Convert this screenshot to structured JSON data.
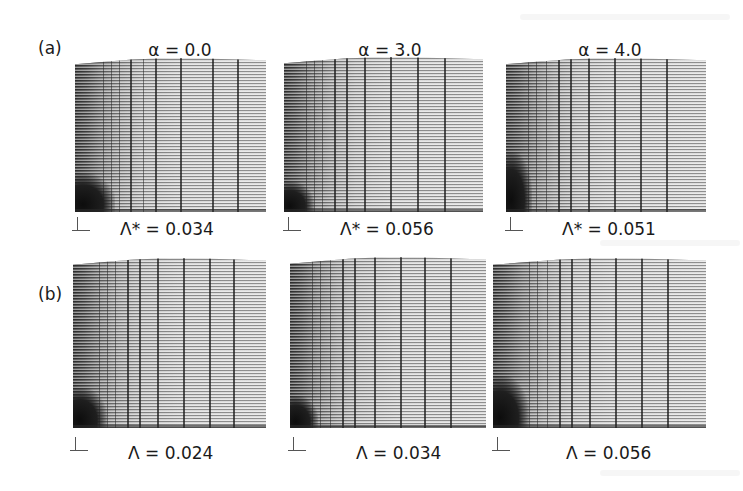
{
  "figure": {
    "rows": [
      {
        "label": "(a)",
        "panels": [
          {
            "title": "α = 0.0",
            "caption": "Λ* = 0.034",
            "symbol": "Λ*",
            "value": "0.034",
            "alpha": "0.0"
          },
          {
            "title": "α = 3.0",
            "caption": "Λ* = 0.056",
            "symbol": "Λ*",
            "value": "0.056",
            "alpha": "3.0"
          },
          {
            "title": "α = 4.0",
            "caption": "Λ* = 0.051",
            "symbol": "Λ*",
            "value": "0.051",
            "alpha": "4.0"
          }
        ]
      },
      {
        "label": "(b)",
        "panels": [
          {
            "caption": "Λ = 0.024",
            "symbol": "Λ",
            "value": "0.024",
            "alpha": "0.0"
          },
          {
            "caption": "Λ = 0.034",
            "symbol": "Λ",
            "value": "0.034",
            "alpha": "3.0"
          },
          {
            "caption": "Λ = 0.056",
            "symbol": "Λ",
            "value": "0.056",
            "alpha": "4.0"
          }
        ]
      }
    ],
    "panel_content": "deformed finite-element mesh",
    "axes_icon": "coordinate-axes-icon",
    "colors": {
      "ink": "#1a1a1a",
      "mesh_dark": "#1e1e1e",
      "mesh_light": "#d3d3d3",
      "background": "#ffffff"
    }
  }
}
